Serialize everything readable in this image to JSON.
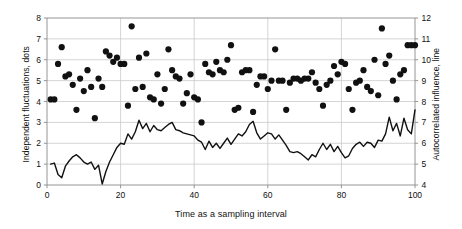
{
  "chart_data": {
    "type": "scatter",
    "title": "",
    "subtitle": "",
    "xlabel": "Time as a sampling interval",
    "ylabel": "Independent fluctuations, dots",
    "ylabel_right": "Autocorrelated influence, line",
    "grid": true,
    "legend": "none",
    "xlim": [
      0,
      100
    ],
    "ylim": [
      0,
      8
    ],
    "ylim_right": [
      4,
      12
    ],
    "xticks": [
      0,
      20,
      40,
      60,
      80,
      100
    ],
    "yticks": [
      0,
      1,
      2,
      3,
      4,
      5,
      6,
      7,
      8
    ],
    "yticks_right": [
      4,
      5,
      6,
      7,
      8,
      9,
      10,
      11,
      12
    ],
    "xticklabels": [
      "0",
      "20",
      "40",
      "60",
      "80",
      "100"
    ],
    "yticklabels": [
      "0",
      "1",
      "2",
      "3",
      "4",
      "5",
      "6",
      "7",
      "8"
    ],
    "yticklabels_right": [
      "4",
      "5",
      "6",
      "7",
      "8",
      "9",
      "10",
      "11",
      "12"
    ],
    "series": [
      {
        "name": "Independent fluctuations",
        "type": "scatter",
        "axis": "left",
        "marker": "o",
        "color": "#111111",
        "markersize": 6.2,
        "x": [
          1,
          2,
          3,
          4,
          5,
          6,
          7,
          8,
          9,
          10,
          11,
          12,
          13,
          14,
          15,
          16,
          17,
          18,
          19,
          20,
          21,
          22,
          23,
          24,
          25,
          26,
          27,
          28,
          29,
          30,
          31,
          32,
          33,
          34,
          35,
          36,
          37,
          38,
          39,
          40,
          41,
          42,
          43,
          44,
          45,
          46,
          47,
          48,
          49,
          50,
          51,
          52,
          53,
          54,
          55,
          56,
          57,
          58,
          59,
          60,
          61,
          62,
          63,
          64,
          65,
          66,
          67,
          68,
          69,
          70,
          71,
          72,
          73,
          74,
          75,
          76,
          77,
          78,
          79,
          80,
          81,
          82,
          83,
          84,
          85,
          86,
          87,
          88,
          89,
          90,
          91,
          92,
          93,
          94,
          95,
          96,
          97,
          98,
          99,
          100
        ],
        "y": [
          4.1,
          4.1,
          5.8,
          6.6,
          5.2,
          5.3,
          4.8,
          3.6,
          5.1,
          4.5,
          5.5,
          4.7,
          3.2,
          5.1,
          4.7,
          6.4,
          6.2,
          5.9,
          6.1,
          5.8,
          5.8,
          3.8,
          7.6,
          4.6,
          6.1,
          4.7,
          6.3,
          4.2,
          4.1,
          5.3,
          3.9,
          4.6,
          6.5,
          5.5,
          5.2,
          5.1,
          3.9,
          4.4,
          5.3,
          4.2,
          4.1,
          3.0,
          5.8,
          5.4,
          5.3,
          5.9,
          5.5,
          5.4,
          6.0,
          6.7,
          3.6,
          3.7,
          5.4,
          5.5,
          5.5,
          3.5,
          4.8,
          5.2,
          5.2,
          4.6,
          5.0,
          6.5,
          5.0,
          5.0,
          3.6,
          4.9,
          5.1,
          5.1,
          5.0,
          5.1,
          5.1,
          5.4,
          4.9,
          4.6,
          3.8,
          4.8,
          5.0,
          5.7,
          5.3,
          5.9,
          5.8,
          4.6,
          3.6,
          4.9,
          5.0,
          5.5,
          4.7,
          4.5,
          6.0,
          4.3,
          7.5,
          5.8,
          6.2,
          5.0,
          4.1,
          5.3,
          5.5,
          6.7,
          6.7,
          6.7
        ]
      },
      {
        "name": "Autocorrelated influence",
        "type": "line",
        "axis": "right",
        "color": "#111111",
        "linewidth": 1.4,
        "x": [
          1,
          2,
          3,
          4,
          5,
          6,
          7,
          8,
          9,
          10,
          11,
          12,
          13,
          14,
          15,
          16,
          17,
          18,
          19,
          20,
          21,
          22,
          23,
          24,
          25,
          26,
          27,
          28,
          29,
          30,
          31,
          32,
          33,
          34,
          35,
          36,
          37,
          38,
          39,
          40,
          41,
          42,
          43,
          44,
          45,
          46,
          47,
          48,
          49,
          50,
          51,
          52,
          53,
          54,
          55,
          56,
          57,
          58,
          59,
          60,
          61,
          62,
          63,
          64,
          65,
          66,
          67,
          68,
          69,
          70,
          71,
          72,
          73,
          74,
          75,
          76,
          77,
          78,
          79,
          80,
          81,
          82,
          83,
          84,
          85,
          86,
          87,
          88,
          89,
          90,
          91,
          92,
          93,
          94,
          95,
          96,
          97,
          98,
          99,
          100
        ],
        "y_right": [
          5.0,
          5.05,
          4.5,
          4.35,
          4.9,
          5.15,
          5.35,
          5.45,
          5.3,
          5.1,
          5.0,
          5.1,
          4.75,
          4.95,
          4.05,
          4.65,
          5.1,
          5.45,
          5.8,
          6.0,
          5.95,
          6.45,
          6.2,
          6.55,
          7.1,
          6.7,
          6.95,
          6.55,
          6.85,
          6.65,
          6.6,
          6.75,
          6.9,
          7.0,
          6.65,
          6.6,
          6.5,
          6.45,
          6.4,
          6.35,
          6.15,
          6.05,
          5.7,
          6.1,
          5.8,
          6.0,
          5.75,
          6.0,
          6.25,
          5.95,
          6.2,
          6.45,
          6.35,
          6.55,
          6.9,
          7.05,
          6.5,
          6.2,
          6.35,
          6.5,
          6.45,
          6.2,
          6.4,
          6.15,
          5.9,
          5.6,
          5.55,
          5.6,
          5.5,
          5.35,
          5.2,
          5.45,
          5.35,
          5.7,
          6.0,
          5.7,
          5.95,
          5.6,
          5.85,
          5.55,
          5.3,
          5.4,
          5.75,
          5.95,
          6.05,
          5.85,
          6.05,
          6.0,
          5.8,
          6.15,
          6.1,
          6.45,
          7.25,
          6.6,
          6.95,
          6.35,
          7.2,
          6.65,
          6.45,
          7.6
        ]
      }
    ]
  },
  "axes": {
    "xlabel": "Time as a sampling interval",
    "ylabel_left": "Independent fluctuations, dots",
    "ylabel_right": "Autocorrelated influence, line"
  }
}
